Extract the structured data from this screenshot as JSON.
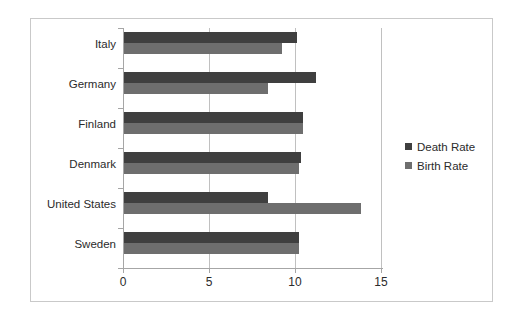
{
  "chart_data": {
    "type": "bar",
    "orientation": "horizontal",
    "title": "",
    "xlabel": "",
    "ylabel": "",
    "xlim": [
      0,
      15
    ],
    "xticks": [
      "0",
      "5",
      "10",
      "15"
    ],
    "xtick_values": [
      0,
      5,
      10,
      15
    ],
    "grid": true,
    "grid_axis": "x",
    "legend_position": "right",
    "categories": [
      "Italy",
      "Germany",
      "Finland",
      "Denmark",
      "United States",
      "Sweden"
    ],
    "series": [
      {
        "name": "Death Rate",
        "color": "#3f3f3f",
        "values": [
          10.1,
          11.2,
          10.4,
          10.3,
          8.4,
          10.2
        ]
      },
      {
        "name": "Birth Rate",
        "color": "#6e6e6e",
        "values": [
          9.2,
          8.4,
          10.4,
          10.2,
          13.8,
          10.2
        ]
      }
    ]
  },
  "frame": {
    "border_color": "#c9c9c9",
    "background": "#ffffff"
  },
  "axis": {
    "line_color": "#a6a6a6",
    "grid_color": "#c0c0c0"
  }
}
